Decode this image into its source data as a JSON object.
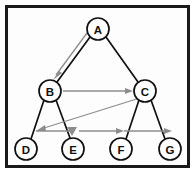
{
  "figure": {
    "frame_color": "#1a1a1a",
    "background_color": "#fdfdfd",
    "edge_color": "#111111",
    "arrow_color": "#8d8d8d",
    "node_fill": "#ffffff"
  },
  "nodes": [
    {
      "id": "A",
      "label": "A",
      "cx": 98,
      "cy": 29,
      "r": 11
    },
    {
      "id": "B",
      "label": "B",
      "cx": 50,
      "cy": 91,
      "r": 11
    },
    {
      "id": "C",
      "label": "C",
      "cx": 145,
      "cy": 91,
      "r": 11
    },
    {
      "id": "D",
      "label": "D",
      "cx": 26,
      "cy": 149,
      "r": 11
    },
    {
      "id": "E",
      "label": "E",
      "cx": 73,
      "cy": 149,
      "r": 11
    },
    {
      "id": "F",
      "label": "F",
      "cx": 121,
      "cy": 149,
      "r": 11
    },
    {
      "id": "G",
      "label": "G",
      "cx": 170,
      "cy": 149,
      "r": 11
    }
  ],
  "tree_edges": [
    {
      "from": "A",
      "to": "B"
    },
    {
      "from": "A",
      "to": "C"
    },
    {
      "from": "B",
      "to": "D"
    },
    {
      "from": "B",
      "to": "E"
    },
    {
      "from": "C",
      "to": "F"
    },
    {
      "from": "C",
      "to": "G"
    }
  ],
  "traversal_arrows": [
    {
      "from": "A",
      "to": "B",
      "style": "offset-parallel"
    },
    {
      "from": "B",
      "to": "C",
      "style": "horizontal"
    },
    {
      "from": "C",
      "to": "D",
      "style": "diagonal"
    },
    {
      "from": "D",
      "to": "E",
      "style": "horizontal"
    },
    {
      "from": "E",
      "to": "F",
      "style": "horizontal"
    },
    {
      "from": "F",
      "to": "G",
      "style": "horizontal"
    }
  ],
  "traversal_order": [
    "A",
    "B",
    "C",
    "D",
    "E",
    "F",
    "G"
  ]
}
